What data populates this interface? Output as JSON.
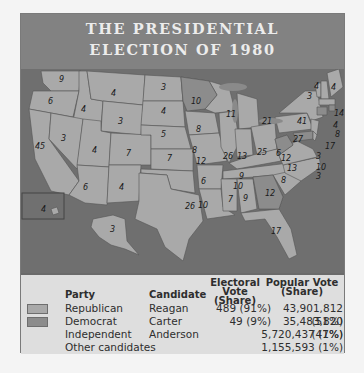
{
  "header": {
    "title_line1": "THE PRESIDENTIAL",
    "title_line2": "ELECTION OF 1980"
  },
  "colors": {
    "republican": "#a9a9a9",
    "democrat": "#8c8c8c",
    "water": "#6f6f6f",
    "header_bg": "#828282",
    "legend_bg": "#dedede"
  },
  "map": {
    "states": [
      {
        "label": "WA",
        "ev": "9"
      },
      {
        "label": "OR",
        "ev": "6"
      },
      {
        "label": "CA",
        "ev": "45"
      },
      {
        "label": "ID",
        "ev": "4"
      },
      {
        "label": "NV",
        "ev": "3"
      },
      {
        "label": "MT",
        "ev": "4"
      },
      {
        "label": "WY",
        "ev": "3"
      },
      {
        "label": "UT",
        "ev": "4"
      },
      {
        "label": "AZ",
        "ev": "6"
      },
      {
        "label": "CO",
        "ev": "7"
      },
      {
        "label": "NM",
        "ev": "4"
      },
      {
        "label": "ND",
        "ev": "3"
      },
      {
        "label": "SD",
        "ev": "4"
      },
      {
        "label": "NE",
        "ev": "5"
      },
      {
        "label": "KS",
        "ev": "7"
      },
      {
        "label": "OK",
        "ev": "8"
      },
      {
        "label": "TX",
        "ev": "26"
      },
      {
        "label": "MN",
        "ev": "10"
      },
      {
        "label": "IA",
        "ev": "8"
      },
      {
        "label": "MO",
        "ev": "12"
      },
      {
        "label": "AR",
        "ev": "6"
      },
      {
        "label": "LA",
        "ev": "10"
      },
      {
        "label": "WI",
        "ev": "11"
      },
      {
        "label": "IL",
        "ev": "26"
      },
      {
        "label": "MI",
        "ev": "21"
      },
      {
        "label": "IN",
        "ev": "13"
      },
      {
        "label": "OH",
        "ev": "25"
      },
      {
        "label": "KY",
        "ev": "9"
      },
      {
        "label": "TN",
        "ev": "10"
      },
      {
        "label": "MS",
        "ev": "7"
      },
      {
        "label": "AL",
        "ev": "9"
      },
      {
        "label": "GA",
        "ev": "12"
      },
      {
        "label": "FL",
        "ev": "17"
      },
      {
        "label": "SC",
        "ev": "8"
      },
      {
        "label": "NC",
        "ev": "13"
      },
      {
        "label": "VA",
        "ev": "12"
      },
      {
        "label": "WV",
        "ev": "6"
      },
      {
        "label": "PA",
        "ev": "27"
      },
      {
        "label": "NY",
        "ev": "41"
      },
      {
        "label": "VT",
        "ev": "3"
      },
      {
        "label": "NH",
        "ev": "4"
      },
      {
        "label": "ME",
        "ev": "4"
      },
      {
        "label": "MA",
        "ev": "14"
      },
      {
        "label": "RI",
        "ev": "4"
      },
      {
        "label": "CT",
        "ev": "8"
      },
      {
        "label": "NJ",
        "ev": "17"
      },
      {
        "label": "DE",
        "ev": "3"
      },
      {
        "label": "MD",
        "ev": "10"
      },
      {
        "label": "DC",
        "ev": "3"
      },
      {
        "label": "HI",
        "ev": "4"
      },
      {
        "label": "AK",
        "ev": "3"
      }
    ]
  },
  "legend": {
    "headers": {
      "party": "Party",
      "candidate": "Candidate",
      "electoral_l1": "Electoral Vote",
      "electoral_l2": "(Share)",
      "popular_l1": "Popular Vote",
      "popular_l2": "(Share)"
    },
    "rows": [
      {
        "party": "Republican",
        "candidate": "Reagan",
        "electoral": "489 (91%)",
        "popular": "43,901,812 (51%)",
        "swatch": "#a9a9a9"
      },
      {
        "party": "Democrat",
        "candidate": "Carter",
        "electoral": "49 (9%)",
        "popular": "35,483,820 (41%)",
        "swatch": "#8c8c8c"
      },
      {
        "party": "Independent",
        "candidate": "Anderson",
        "electoral": "",
        "popular": "5,720,437 (7%)"
      },
      {
        "party": "Other candidates",
        "candidate": "",
        "electoral": "",
        "popular": "1,155,593 (1%)"
      }
    ]
  }
}
